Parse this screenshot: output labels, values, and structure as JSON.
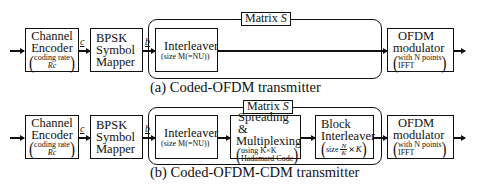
{
  "diagrams": {
    "a": {
      "caption": "(a) Coded-OFDM transmitter",
      "frame_label": "Matrix S",
      "frame_label_prefix": "Matrix ",
      "frame_label_var": "S",
      "blocks": [
        {
          "id": "channel-encoder",
          "lines": [
            "Channel",
            "Encoder"
          ],
          "sub_line1": "coding rate",
          "sub_line2": "Rc"
        },
        {
          "id": "bpsk-mapper",
          "lines": [
            "BPSK",
            "Symbol",
            "Mapper"
          ]
        },
        {
          "id": "interleaver",
          "lines": [
            "Interleaver"
          ],
          "sub_line1": "size M(=NU)"
        },
        {
          "id": "ofdm-modulator",
          "lines": [
            "OFDM",
            "modulator"
          ],
          "sub_line1": "with  N points",
          "sub_line2": "IFFT"
        }
      ],
      "signals": {
        "c": "c",
        "b": "b"
      }
    },
    "b": {
      "caption": "(b) Coded-OFDM-CDM transmitter",
      "frame_label": "Matrix S",
      "frame_label_prefix": "Matrix ",
      "frame_label_var": "S",
      "blocks": [
        {
          "id": "channel-encoder",
          "lines": [
            "Channel",
            "Encoder"
          ],
          "sub_line1": "coding rate",
          "sub_line2": "Rc"
        },
        {
          "id": "bpsk-mapper",
          "lines": [
            "BPSK",
            "Symbol",
            "Mapper"
          ]
        },
        {
          "id": "interleaver",
          "lines": [
            "Interleaver"
          ],
          "sub_line1": "size M(=NU)"
        },
        {
          "id": "spreading-multiplexing",
          "lines": [
            "Spreading &",
            "Multiplexing"
          ],
          "sub_line1": "using  K×K",
          "sub_line2": "Hadamard Code"
        },
        {
          "id": "block-interleaver",
          "lines": [
            "Block",
            "Interleaver"
          ],
          "sub_line1": "size N/K × K"
        },
        {
          "id": "ofdm-modulator",
          "lines": [
            "OFDM",
            "modulator"
          ],
          "sub_line1": "with  N points",
          "sub_line2": "IFFT"
        }
      ],
      "signals": {
        "c": "c",
        "b": "b"
      }
    }
  },
  "glyphs": {
    "paren_open": "(",
    "paren_close": ")",
    "frac_num": "N",
    "frac_den": "K",
    "times": "×",
    "K": "K"
  }
}
